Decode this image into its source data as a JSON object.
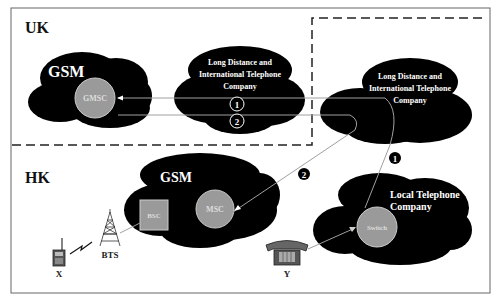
{
  "regions": {
    "uk": {
      "label": "UK"
    },
    "hk": {
      "label": "HK"
    }
  },
  "clouds": {
    "uk_gsm": {
      "label": "GSM",
      "node": "GMSC"
    },
    "uk_ld": {
      "label_lines": [
        "Long Distance and",
        "International Telephone",
        "Company"
      ]
    },
    "intl_ld": {
      "label_lines": [
        "Long Distance and",
        "International Telephone",
        "Company"
      ]
    },
    "hk_gsm": {
      "label": "GSM",
      "node_bsc": "BSC",
      "node_msc": "MSC"
    },
    "local": {
      "label_lines": [
        "Local Telephone",
        "Company"
      ],
      "node": "Switch"
    }
  },
  "devices": {
    "mobile": {
      "label": "X"
    },
    "tower": {
      "label": "BTS"
    },
    "phone": {
      "label": "Y"
    }
  },
  "steps": {
    "s1_outline": "1",
    "s2_outline": "2",
    "s1_filled": "1",
    "s2_filled": "2"
  },
  "colors": {
    "cloud": "#000000",
    "node": "#9a9a9a",
    "line": "#a0a0a0",
    "frame": "#555555"
  }
}
